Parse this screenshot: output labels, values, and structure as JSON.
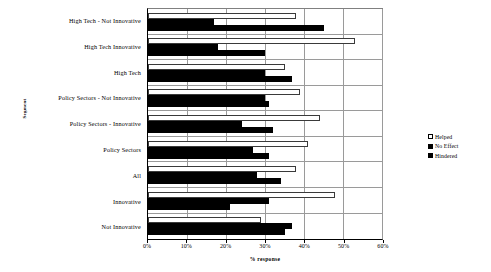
{
  "chart_data": {
    "type": "bar",
    "orientation": "horizontal",
    "title": "",
    "xlabel": "% response",
    "ylabel": "Segment",
    "xlim": [
      0,
      60
    ],
    "xticks": [
      0,
      10,
      20,
      30,
      40,
      50,
      60
    ],
    "xtick_labels": [
      "0%",
      "10%",
      "20%",
      "30%",
      "40%",
      "50%",
      "60%"
    ],
    "grid": true,
    "legend_position": "right",
    "categories": [
      "High Tech - Not Innovative",
      "High Tech Innovative",
      "High Tech",
      "Policy Sectors - Not Innovative",
      "Policy Sectors - Innovative",
      "Policy Sectors",
      "All",
      "Innovative",
      "Not Innovative"
    ],
    "series": [
      {
        "name": "Helped",
        "color": "#ffffff",
        "values": [
          38,
          53,
          35,
          39,
          44,
          41,
          38,
          48,
          29
        ]
      },
      {
        "name": "No Effect",
        "color": "#000000",
        "values": [
          17,
          18,
          30,
          30,
          24,
          27,
          28,
          31,
          37
        ]
      },
      {
        "name": "Hindered",
        "color": "#000000",
        "values": [
          45,
          30,
          37,
          31,
          32,
          31,
          34,
          21,
          35
        ]
      }
    ]
  },
  "axes": {
    "y_title": "Segment",
    "x_title": "% response"
  },
  "legend": {
    "items": [
      {
        "label": "Helped",
        "swatch": "open"
      },
      {
        "label": "No Effect",
        "swatch": "filled"
      },
      {
        "label": "Hindered",
        "swatch": "filled"
      }
    ]
  }
}
